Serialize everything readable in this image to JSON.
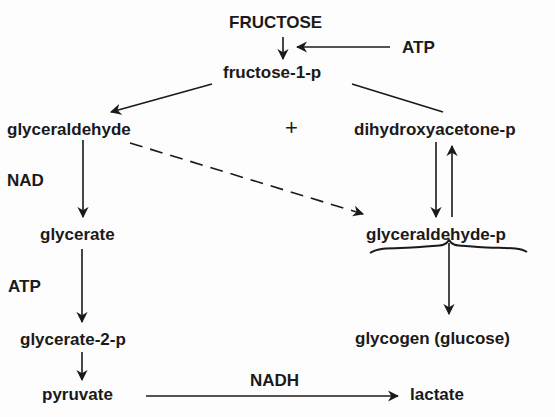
{
  "diagram": {
    "nodes": {
      "fructose": "FRUCTOSE",
      "atp_top": "ATP",
      "fructose_1_p": "fructose-1-p",
      "glyceraldehyde": "glyceraldehyde",
      "plus": "+",
      "dihydroxyacetone_p": "dihydroxyacetone-p",
      "nad": "NAD",
      "glycerate": "glycerate",
      "glyceraldehyde_p": "glyceraldehyde-p",
      "atp_mid": "ATP",
      "glycerate_2_p": "glycerate-2-p",
      "glycogen": "glycogen (glucose)",
      "pyruvate": "pyruvate",
      "nadh": "NADH",
      "lactate": "lactate"
    },
    "edges": [
      {
        "from": "fructose",
        "to": "fructose-1-p",
        "style": "solid"
      },
      {
        "from": "ATP",
        "to": "fructose-1-p step",
        "style": "solid"
      },
      {
        "from": "fructose-1-p",
        "to": "glyceraldehyde",
        "style": "solid"
      },
      {
        "from": "fructose-1-p",
        "to": "dihydroxyacetone-p",
        "style": "solid-line"
      },
      {
        "from": "glyceraldehyde",
        "to": "glycerate",
        "style": "solid",
        "cofactor": "NAD"
      },
      {
        "from": "glycerate",
        "to": "glycerate-2-p",
        "style": "solid",
        "cofactor": "ATP"
      },
      {
        "from": "glycerate-2-p",
        "to": "pyruvate",
        "style": "solid"
      },
      {
        "from": "pyruvate",
        "to": "lactate",
        "style": "solid",
        "cofactor": "NADH"
      },
      {
        "from": "glyceraldehyde",
        "to": "glyceraldehyde-p",
        "style": "dashed"
      },
      {
        "from": "dihydroxyacetone-p",
        "to": "glyceraldehyde-p",
        "style": "solid"
      },
      {
        "from": "glyceraldehyde-p",
        "to": "dihydroxyacetone-p",
        "style": "solid"
      },
      {
        "from": "glyceraldehyde-p",
        "to": "glycogen (glucose)",
        "style": "brace"
      }
    ]
  }
}
